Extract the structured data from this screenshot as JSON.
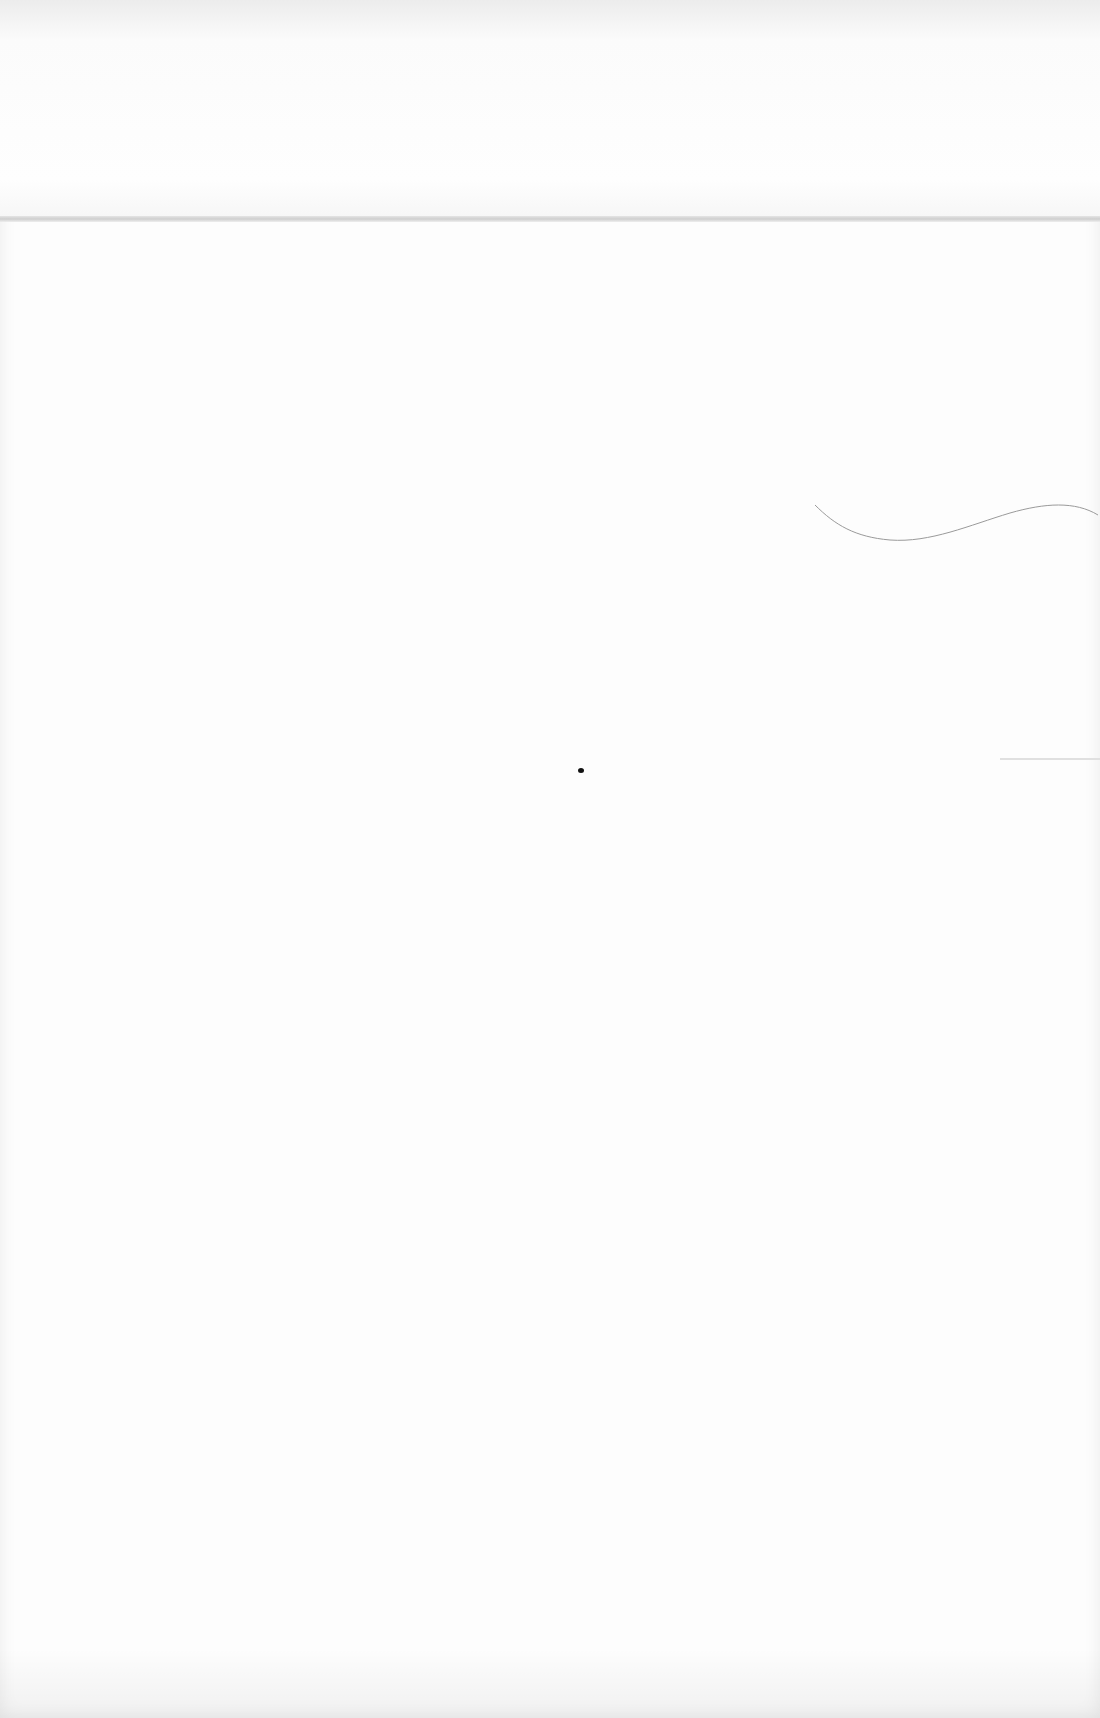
{
  "document": {
    "type": "blank scanned page",
    "text_content": "",
    "marks": [
      {
        "name": "paper-fold",
        "position": "top",
        "y": 218
      },
      {
        "name": "stray-fiber",
        "position": "right-middle"
      },
      {
        "name": "ink-speck",
        "position": "center"
      },
      {
        "name": "edge-line",
        "position": "right-edge"
      }
    ]
  },
  "colors": {
    "paper": "#fdfdfd",
    "fold": "#c9c9c9",
    "fiber": "#9a9a9a",
    "speck": "#111111"
  }
}
